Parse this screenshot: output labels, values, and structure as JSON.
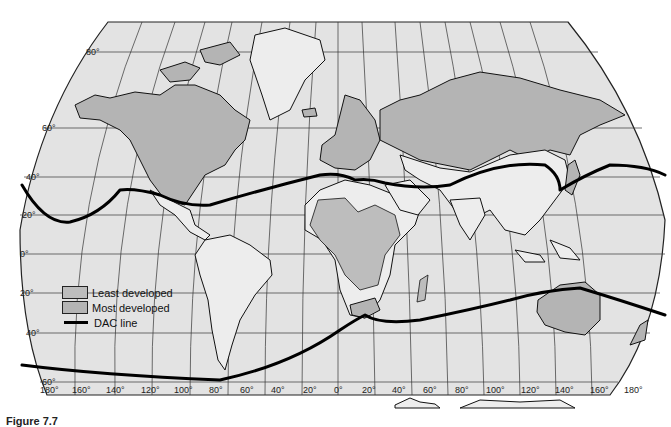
{
  "map": {
    "title": "World development classification with DAC line",
    "projection": "Robinson-like",
    "colors": {
      "ocean": "#e3e3e3",
      "least_developed": "#bdbdbd",
      "most_developed": "#b4b4b4",
      "other_land": "#ededed",
      "dac_line": "#000000"
    },
    "latitude_labels": [
      "80°",
      "60°",
      "40°",
      "20°",
      "0°",
      "-20°",
      "-40°",
      "-60°"
    ],
    "longitude_labels": [
      "180°",
      "160°",
      "140°",
      "120°",
      "100°",
      "80°",
      "60°",
      "40°",
      "20°",
      "0°",
      "20°",
      "40°",
      "60°",
      "80°",
      "100°",
      "120°",
      "140°",
      "160°",
      "180°"
    ]
  },
  "legend": {
    "items": [
      {
        "label": "Least developed",
        "type": "swatch",
        "color": "#bdbdbd"
      },
      {
        "label": "Most developed",
        "type": "swatch",
        "color": "#b4b4b4"
      },
      {
        "label": "DAC line",
        "type": "line",
        "color": "#000000"
      }
    ]
  },
  "caption": {
    "text": "Figure 7.7"
  }
}
